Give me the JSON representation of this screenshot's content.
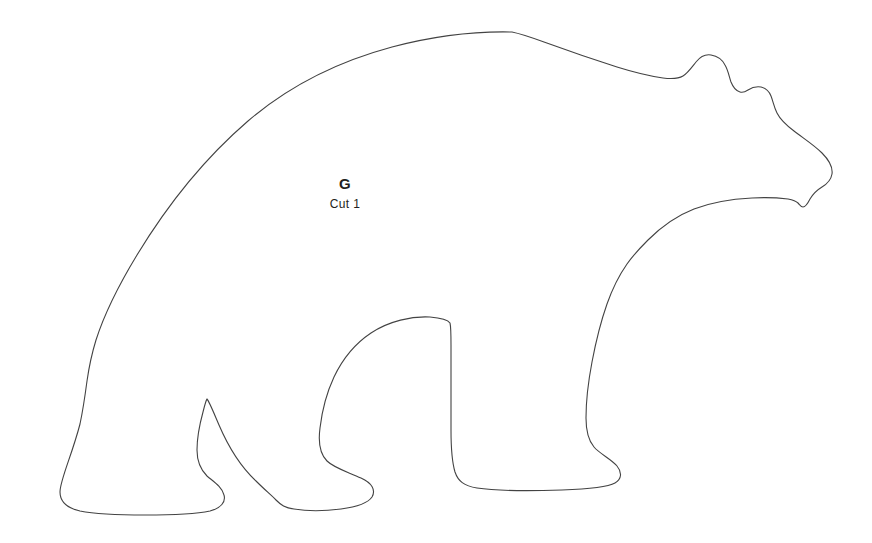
{
  "sheet": {
    "title": "Bear pattern piece template",
    "background_color": "#ffffff",
    "outline_color": "#434343",
    "width": 872,
    "height": 543
  },
  "piece": {
    "shape_name": "bear-silhouette",
    "letter": "G",
    "cut_instruction": "Cut 1"
  }
}
